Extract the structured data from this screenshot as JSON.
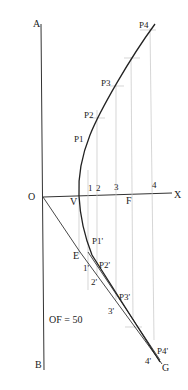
{
  "diagram": {
    "labels": {
      "A": "A",
      "B": "B",
      "O": "O",
      "X": "X",
      "V": "V",
      "F": "F",
      "E": "E",
      "G": "G",
      "div1": "1",
      "div2": "2",
      "div3": "3",
      "div4": "4",
      "P1": "P1",
      "P2": "P2",
      "P3": "P3",
      "P4": "P4",
      "P1p": "P1'",
      "P2p": "P2'",
      "P3p": "P3'",
      "P4p": "P4'",
      "d1p": "1'",
      "d2p": "2'",
      "d3p": "3'",
      "d4p": "4'",
      "annotation": "OF = 50"
    },
    "colors": {
      "curve": "#222222",
      "line": "#333333",
      "construction": "#bdbdbd",
      "background": "#ffffff"
    }
  }
}
